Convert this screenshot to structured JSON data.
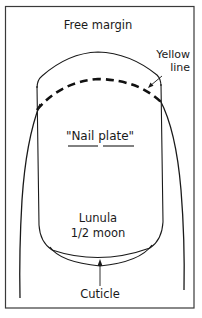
{
  "diagram": {
    "type": "labeled-anatomy-diagram",
    "labels": {
      "free_margin": "Free margin",
      "yellow_line_1": "Yellow",
      "yellow_line_2": "line",
      "nail_plate": "\"Nail plate\"",
      "nail_plate_word1": "Nail",
      "nail_plate_word2": "plate",
      "lunula": "Lunula",
      "half_moon": "1/2 moon",
      "cuticle": "Cuticle"
    },
    "colors": {
      "ink": "#1a1a1a",
      "frame": "#3a3a3a",
      "background": "#ffffff"
    }
  }
}
